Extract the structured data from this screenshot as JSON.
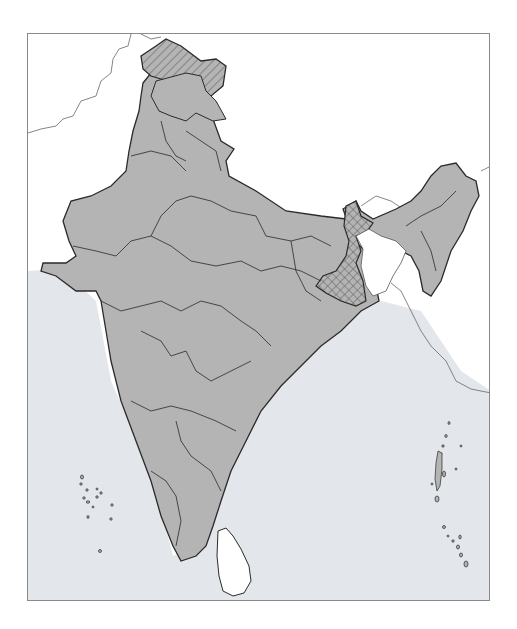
{
  "map": {
    "subject": "Outline map of India with state boundaries",
    "colors": {
      "land_fill": "#b4b4b4",
      "sea_fill": "#e3e6ea",
      "neighbor_land": "#ffffff",
      "border_stroke": "#2a2a2a",
      "frame_stroke": "#8a8a8a"
    },
    "legend_patterns": {
      "diagonal_hatch": "Northern region (Jammu & Kashmir / Ladakh area)",
      "cross_hatch": "West Bengal"
    },
    "features": [
      "mainland-states",
      "lakshadweep-islands",
      "andaman-nicobar-islands",
      "sri-lanka",
      "neighboring-borders"
    ]
  }
}
